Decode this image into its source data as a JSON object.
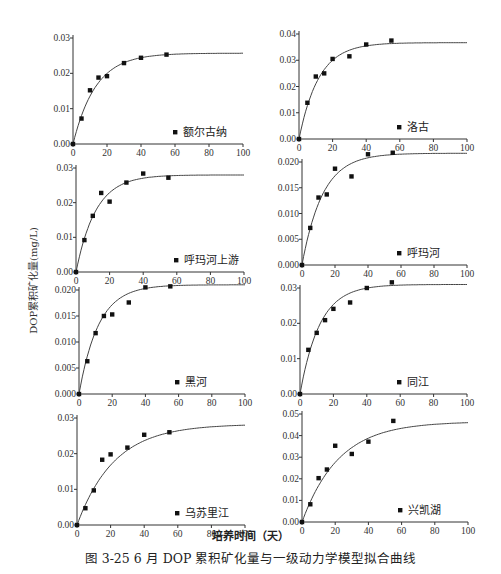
{
  "figure": {
    "caption": "图 3-25   6 月 DOP 累积矿化量与一级动力学模型拟合曲线",
    "shared_ylabel": "DOP累积矿化量(mg/L)",
    "shared_xlabel": "培养时间（天）"
  },
  "chart_data": [
    {
      "type": "scatter",
      "title": "额尔古纳",
      "legend": "额尔古纳",
      "xlabel": "培养时间（天）",
      "ylabel": "DOP累积矿化量(mg/L)",
      "xlim": [
        0,
        100
      ],
      "ylim": [
        0,
        0.03
      ],
      "xticks": [
        0,
        20,
        40,
        60,
        80,
        100
      ],
      "yticks": [
        "0.00",
        "0.01",
        "0.02",
        "0.03"
      ],
      "x": [
        0,
        5,
        10,
        15,
        20,
        30,
        40,
        55
      ],
      "y": [
        0.0,
        0.0072,
        0.0152,
        0.0188,
        0.0192,
        0.0229,
        0.0244,
        0.0253
      ],
      "fit": {
        "model": "first-order kinetics",
        "C0": 0.0257,
        "k": 0.075
      }
    },
    {
      "type": "scatter",
      "title": "洛古",
      "legend": "洛古",
      "xlabel": "培养时间（天）",
      "ylabel": "DOP累积矿化量(mg/L)",
      "xlim": [
        0,
        100
      ],
      "ylim": [
        0,
        0.04
      ],
      "xticks": [
        0,
        20,
        40,
        60,
        80,
        100
      ],
      "yticks": [
        "0.00",
        "0.01",
        "0.02",
        "0.03",
        "0.04"
      ],
      "x": [
        0,
        5,
        10,
        15,
        20,
        30,
        40,
        55
      ],
      "y": [
        0.0,
        0.0138,
        0.0238,
        0.025,
        0.0305,
        0.0315,
        0.036,
        0.0375
      ],
      "fit": {
        "model": "first-order kinetics",
        "C0": 0.0367,
        "k": 0.085
      }
    },
    {
      "type": "scatter",
      "title": "呼玛河上游",
      "legend": "呼玛河上游",
      "xlabel": "培养时间（天）",
      "ylabel": "DOP累积矿化量(mg/L)",
      "xlim": [
        0,
        100
      ],
      "ylim": [
        0,
        0.03
      ],
      "xticks": [
        0,
        20,
        40,
        60,
        80,
        100
      ],
      "yticks": [
        "0.00",
        "0.01",
        "0.02",
        "0.03"
      ],
      "x": [
        0,
        5,
        10,
        15,
        20,
        30,
        40,
        55
      ],
      "y": [
        0.0,
        0.0092,
        0.0162,
        0.0228,
        0.0203,
        0.0258,
        0.0284,
        0.0272
      ],
      "fit": {
        "model": "first-order kinetics",
        "C0": 0.028,
        "k": 0.085
      }
    },
    {
      "type": "scatter",
      "title": "呼玛河",
      "legend": "呼玛河",
      "xlabel": "培养时间（天）",
      "ylabel": "DOP累积矿化量(mg/L)",
      "xlim": [
        0,
        100
      ],
      "ylim": [
        0,
        0.022
      ],
      "xticks": [
        0,
        20,
        40,
        60,
        80,
        100
      ],
      "yticks": [
        "0.000",
        "0.005",
        "0.010",
        "0.015",
        "0.020"
      ],
      "x": [
        0,
        5,
        10,
        15,
        20,
        30,
        40,
        55
      ],
      "y": [
        0.0,
        0.0072,
        0.0131,
        0.0137,
        0.0187,
        0.0172,
        0.0215,
        0.0218
      ],
      "fit": {
        "model": "first-order kinetics",
        "C0": 0.0217,
        "k": 0.08
      }
    },
    {
      "type": "scatter",
      "title": "黑河",
      "legend": "黑河",
      "xlabel": "培养时间（天）",
      "ylabel": "DOP累积矿化量(mg/L)",
      "xlim": [
        0,
        100
      ],
      "ylim": [
        0,
        0.022
      ],
      "xticks": [
        0,
        20,
        40,
        60,
        80,
        100
      ],
      "yticks": [
        "0.000",
        "0.005",
        "0.010",
        "0.015",
        "0.020"
      ],
      "x": [
        0,
        5,
        10,
        15,
        20,
        30,
        40,
        55
      ],
      "y": [
        0.0,
        0.0063,
        0.0117,
        0.015,
        0.0153,
        0.0176,
        0.0205,
        0.0207
      ],
      "fit": {
        "model": "first-order kinetics",
        "C0": 0.021,
        "k": 0.085
      }
    },
    {
      "type": "scatter",
      "title": "同江",
      "legend": "同江",
      "xlabel": "培养时间（天）",
      "ylabel": "DOP累积矿化量(mg/L)",
      "xlim": [
        0,
        100
      ],
      "ylim": [
        0,
        0.033
      ],
      "xticks": [
        0,
        20,
        40,
        60,
        80,
        100
      ],
      "yticks": [
        "0.00",
        "0.01",
        "0.02",
        "0.03"
      ],
      "x": [
        0,
        5,
        10,
        15,
        20,
        30,
        40,
        55
      ],
      "y": [
        0.0,
        0.0125,
        0.0173,
        0.0209,
        0.0241,
        0.0259,
        0.03,
        0.0316
      ],
      "fit": {
        "model": "first-order kinetics",
        "C0": 0.031,
        "k": 0.085
      }
    },
    {
      "type": "scatter",
      "title": "乌苏里江",
      "legend": "乌苏里江",
      "xlabel": "培养时间（天）",
      "ylabel": "DOP累积矿化量(mg/L)",
      "xlim": [
        0,
        100
      ],
      "ylim": [
        0,
        0.03
      ],
      "xticks": [
        0,
        20,
        40,
        60,
        80,
        100
      ],
      "yticks": [
        "0.00",
        "0.01",
        "0.02",
        "0.03"
      ],
      "x": [
        0,
        5,
        10,
        15,
        20,
        30,
        40,
        55
      ],
      "y": [
        0.0,
        0.0047,
        0.0097,
        0.0183,
        0.0198,
        0.0217,
        0.0253,
        0.026
      ],
      "fit": {
        "model": "first-order kinetics",
        "C0": 0.0283,
        "k": 0.045
      }
    },
    {
      "type": "scatter",
      "title": "兴凯湖",
      "legend": "兴凯湖",
      "xlabel": "培养时间（天）",
      "ylabel": "DOP累积矿化量(mg/L)",
      "xlim": [
        0,
        100
      ],
      "ylim": [
        0,
        0.05
      ],
      "xticks": [
        0,
        20,
        40,
        60,
        80,
        100
      ],
      "yticks": [
        "0.00",
        "0.01",
        "0.02",
        "0.03",
        "0.04",
        "0.05"
      ],
      "x": [
        0,
        5,
        10,
        15,
        20,
        30,
        40,
        55
      ],
      "y": [
        0.0,
        0.0082,
        0.0203,
        0.0243,
        0.0353,
        0.0315,
        0.0372,
        0.0468
      ],
      "fit": {
        "model": "first-order kinetics",
        "C0": 0.0465,
        "k": 0.045
      }
    }
  ]
}
